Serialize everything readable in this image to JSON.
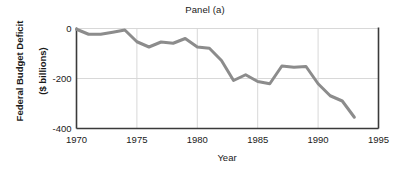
{
  "chart_data": {
    "type": "line",
    "title": "Panel (a)",
    "xlabel": "Year",
    "ylabel": "Federal Budget Deficit\n($ billions)",
    "ylabel_line1": "Federal Budget Deficit",
    "ylabel_line2": "($ billions)",
    "xlim": [
      1970,
      1995
    ],
    "ylim": [
      -400,
      0
    ],
    "xticks": [
      1970,
      1975,
      1980,
      1985,
      1990,
      1995
    ],
    "xtick_labels": [
      "1970",
      "1975",
      "1980",
      "1985",
      "1990",
      "1995"
    ],
    "yticks": [
      0,
      -200,
      -400
    ],
    "ytick_labels": [
      "0",
      "-200",
      "-400"
    ],
    "grid": true,
    "legend": false,
    "series": [
      {
        "name": "Federal Budget Deficit",
        "color": "#8c8c8c",
        "x": [
          1970,
          1971,
          1972,
          1973,
          1974,
          1975,
          1976,
          1977,
          1978,
          1979,
          1980,
          1981,
          1982,
          1983,
          1984,
          1985,
          1986,
          1987,
          1988,
          1989,
          1990,
          1991,
          1992,
          1993
        ],
        "values": [
          -3,
          -23,
          -23,
          -15,
          -6,
          -53,
          -74,
          -54,
          -59,
          -40,
          -74,
          -79,
          -128,
          -208,
          -185,
          -212,
          -221,
          -150,
          -155,
          -152,
          -221,
          -269,
          -290,
          -355
        ]
      }
    ]
  },
  "colors": {
    "line": "#8c8c8c",
    "axis": "#3a3a3a",
    "grid": "#d8d8d8",
    "text": "#1a1a1a",
    "background": "#ffffff"
  },
  "axes": {
    "x_axis_name": "year-axis",
    "y_axis_name": "deficit-axis"
  }
}
